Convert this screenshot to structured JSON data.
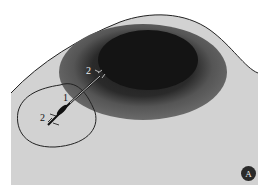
{
  "figure": {
    "panel_label": "A",
    "labels": [
      {
        "id": "label-1",
        "text": "1"
      },
      {
        "id": "label-2-upper",
        "text": "2"
      },
      {
        "id": "label-2-lower",
        "text": "2"
      }
    ],
    "colors": {
      "background": "#ffffff",
      "sclera": "#d2d2d2",
      "iris": "#5a5a5a",
      "pupil": "#141414",
      "outline": "#222222"
    }
  }
}
